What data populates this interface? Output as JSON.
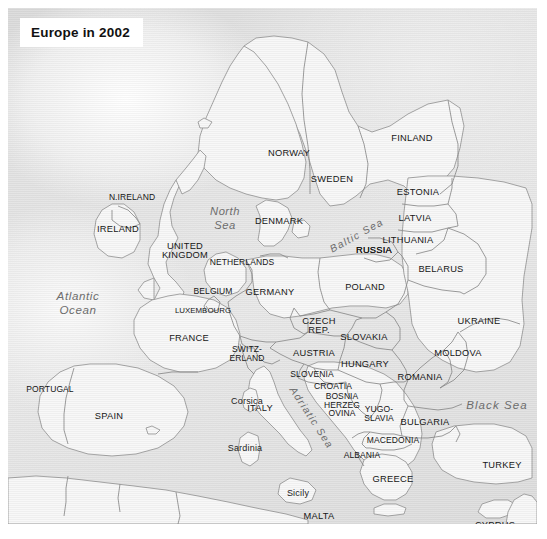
{
  "figure": {
    "title": "Europe in 2002",
    "kind": "political-map",
    "region": "Europe"
  },
  "colors": {
    "land": "#f8f8f8",
    "sea": "#dcdcdc",
    "border": "#8a8a8a",
    "coastline": "#9a9a9a",
    "label_text": "#161616",
    "sea_label_text": "#6d6d6d",
    "plate_background": "#ffffff",
    "page_background": "#ffffff"
  },
  "countries": [
    {
      "name": "N.IRELAND",
      "x": 124,
      "y": 189,
      "size": "small"
    },
    {
      "name": "IRELAND",
      "x": 110,
      "y": 222,
      "size": "normal"
    },
    {
      "name": "UNITED\nKINGDOM",
      "x": 177,
      "y": 243,
      "size": "normal"
    },
    {
      "name": "NORWAY",
      "x": 281,
      "y": 146,
      "size": "normal"
    },
    {
      "name": "SWEDEN",
      "x": 324,
      "y": 172,
      "size": "normal"
    },
    {
      "name": "FINLAND",
      "x": 404,
      "y": 131,
      "size": "normal"
    },
    {
      "name": "DENMARK",
      "x": 271,
      "y": 214,
      "size": "normal"
    },
    {
      "name": "ESTONIA",
      "x": 410,
      "y": 185,
      "size": "normal"
    },
    {
      "name": "LATVIA",
      "x": 407,
      "y": 211,
      "size": "normal"
    },
    {
      "name": "LITHUANIA",
      "x": 400,
      "y": 233,
      "size": "normal"
    },
    {
      "name": "RUSSIA",
      "x": 485,
      "y": 203,
      "size": "normal"
    },
    {
      "name": "RUSSIA",
      "x": 366,
      "y": 243,
      "size": "normal"
    },
    {
      "name": "BELARUS",
      "x": 433,
      "y": 262,
      "size": "normal"
    },
    {
      "name": "POLAND",
      "x": 357,
      "y": 280,
      "size": "normal"
    },
    {
      "name": "NETHERLANDS",
      "x": 234,
      "y": 254,
      "size": "small"
    },
    {
      "name": "BELGIUM",
      "x": 205,
      "y": 283,
      "size": "small"
    },
    {
      "name": "LUXEMBOURG",
      "x": 195,
      "y": 303,
      "size": "tiny"
    },
    {
      "name": "GERMANY",
      "x": 262,
      "y": 285,
      "size": "normal"
    },
    {
      "name": "UKRAINE",
      "x": 471,
      "y": 314,
      "size": "normal"
    },
    {
      "name": "CZECH\nREP.",
      "x": 311,
      "y": 318,
      "size": "normal"
    },
    {
      "name": "SLOVAKIA",
      "x": 356,
      "y": 330,
      "size": "normal"
    },
    {
      "name": "FRANCE",
      "x": 181,
      "y": 331,
      "size": "normal"
    },
    {
      "name": "SWITZ-\nERLAND",
      "x": 239,
      "y": 346,
      "size": "small"
    },
    {
      "name": "AUSTRIA",
      "x": 306,
      "y": 346,
      "size": "normal"
    },
    {
      "name": "HUNGARY",
      "x": 357,
      "y": 357,
      "size": "normal"
    },
    {
      "name": "MOLDOVA",
      "x": 450,
      "y": 346,
      "size": "normal"
    },
    {
      "name": "SLOVENIA",
      "x": 304,
      "y": 366,
      "size": "small"
    },
    {
      "name": "CROATIA",
      "x": 325,
      "y": 378,
      "size": "small"
    },
    {
      "name": "ROMANIA",
      "x": 412,
      "y": 370,
      "size": "normal"
    },
    {
      "name": "BOSNIA\nHERZEG\nOVINA",
      "x": 334,
      "y": 397,
      "size": "small"
    },
    {
      "name": "YUGO-\nSLAVIA",
      "x": 371,
      "y": 406,
      "size": "small"
    },
    {
      "name": "ITALY",
      "x": 252,
      "y": 401,
      "size": "normal"
    },
    {
      "name": "BULGARIA",
      "x": 417,
      "y": 415,
      "size": "normal"
    },
    {
      "name": "MACEDONIA",
      "x": 385,
      "y": 432,
      "size": "small"
    },
    {
      "name": "ALBANIA",
      "x": 354,
      "y": 447,
      "size": "small"
    },
    {
      "name": "PORTUGAL",
      "x": 42,
      "y": 381,
      "size": "small"
    },
    {
      "name": "SPAIN",
      "x": 101,
      "y": 409,
      "size": "normal"
    },
    {
      "name": "GREECE",
      "x": 385,
      "y": 472,
      "size": "normal"
    },
    {
      "name": "TURKEY",
      "x": 494,
      "y": 458,
      "size": "normal"
    },
    {
      "name": "MALTA",
      "x": 311,
      "y": 509,
      "size": "normal"
    },
    {
      "name": "CYPRYS",
      "x": 487,
      "y": 518,
      "size": "normal"
    }
  ],
  "country_overrides": {
    "cyprus_label": "CYPRUS"
  },
  "islands": [
    {
      "name": "Corsica",
      "x": 239,
      "y": 394
    },
    {
      "name": "Sardinia",
      "x": 237,
      "y": 441
    },
    {
      "name": "Sicily",
      "x": 290,
      "y": 486
    }
  ],
  "seas": [
    {
      "name": "North\nSea",
      "x": 217,
      "y": 210,
      "style": "northsea",
      "rotation": 0
    },
    {
      "name": "Atlantic\nOcean",
      "x": 70,
      "y": 295,
      "style": "ocean",
      "rotation": 0
    },
    {
      "name": "Baltic Sea",
      "x": 349,
      "y": 228,
      "style": "small",
      "rotation": -29
    },
    {
      "name": "Adriatic Sea",
      "x": 303,
      "y": 410,
      "style": "small",
      "rotation": 57
    },
    {
      "name": "Black Sea",
      "x": 489,
      "y": 398,
      "style": "normal",
      "rotation": 0
    },
    {
      "name": "Mediterranean Sea",
      "x": 235,
      "y": 460,
      "style": "curved",
      "rotation": 0
    }
  ],
  "mediterranean_label": "Mediterranean Sea"
}
